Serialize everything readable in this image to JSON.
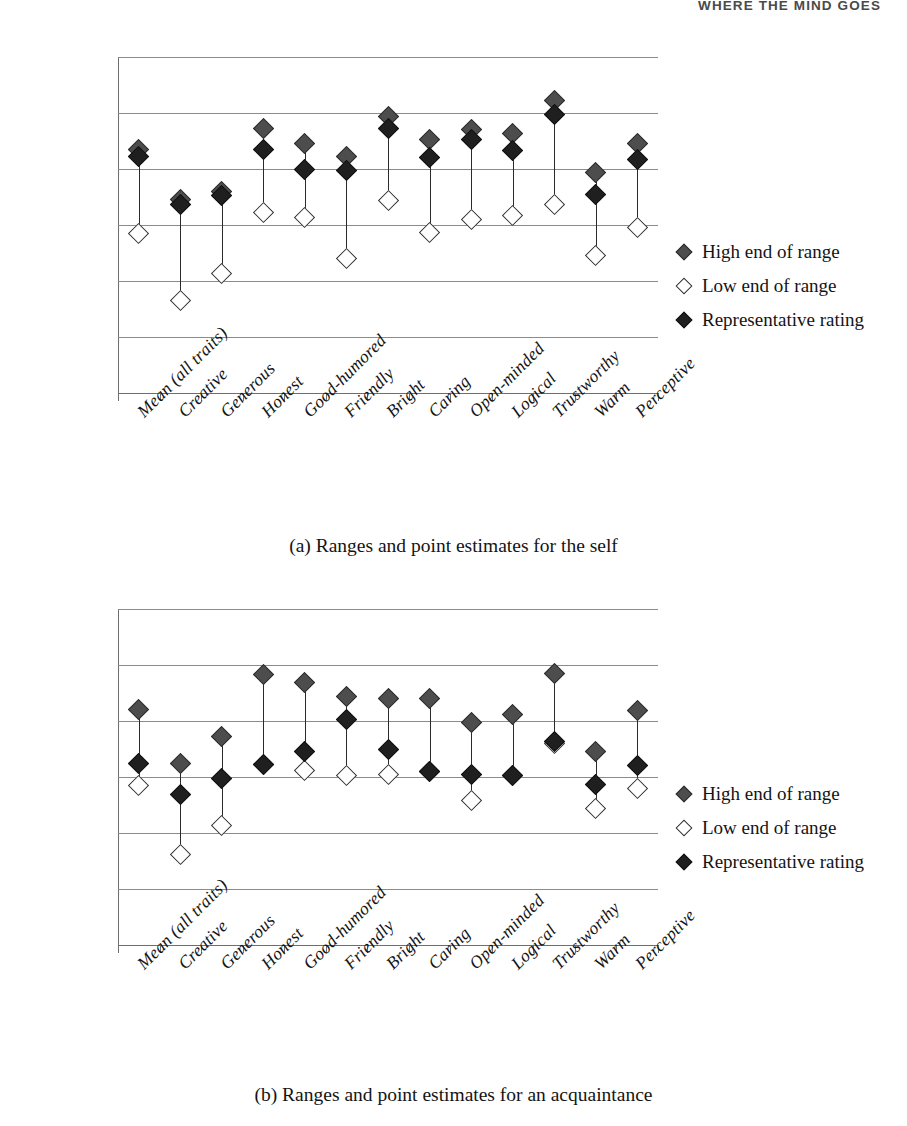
{
  "page": {
    "running_head": "WHERE THE MIND GOES"
  },
  "legend": {
    "items": [
      {
        "key": "high",
        "label": "High end of range",
        "marker": "filled-diamond-gray"
      },
      {
        "key": "low",
        "label": "Low end of range",
        "marker": "open-diamond"
      },
      {
        "key": "rep",
        "label": "Representative rating",
        "marker": "filled-diamond-black"
      }
    ]
  },
  "figures": [
    {
      "id": "a",
      "caption": "(a) Ranges and point estimates for the self",
      "chart_data": {
        "type": "scatter",
        "title": "",
        "xlabel": "",
        "ylabel": "",
        "ylim": [
          30,
          90
        ],
        "yticks": [
          30,
          40,
          50,
          60,
          70,
          80,
          90
        ],
        "grid": true,
        "legend_position": "right",
        "categories": [
          "Mean (all traits)",
          "Creative",
          "Generous",
          "Honest",
          "Good-humored",
          "Friendly",
          "Bright",
          "Caring",
          "Open-minded",
          "Logical",
          "Trustworthy",
          "Warm",
          "Perceptive"
        ],
        "series": [
          {
            "name": "High end of range",
            "values": [
              73.5,
              64.5,
              66.0,
              77.3,
              74.5,
              72.3,
              79.3,
              75.3,
              77.0,
              76.3,
              82.3,
              69.3,
              74.5
            ]
          },
          {
            "name": "Low end of range",
            "values": [
              58.5,
              46.6,
              51.3,
              62.2,
              61.3,
              54.0,
              64.3,
              58.6,
              61.0,
              61.7,
              63.6,
              54.6,
              59.5
            ]
          },
          {
            "name": "Representative rating",
            "values": [
              72.2,
              63.6,
              65.2,
              73.5,
              70.0,
              69.8,
              77.2,
              72.0,
              75.2,
              73.3,
              79.8,
              65.5,
              71.7
            ]
          }
        ]
      }
    },
    {
      "id": "b",
      "caption": "(b) Ranges and point estimates for an acquaintance",
      "chart_data": {
        "type": "scatter",
        "title": "",
        "xlabel": "",
        "ylabel": "",
        "ylim": [
          30,
          90
        ],
        "yticks": [
          30,
          40,
          50,
          60,
          70,
          80,
          90
        ],
        "grid": true,
        "legend_position": "right",
        "categories": [
          "Mean (all traits)",
          "Creative",
          "Generous",
          "Honest",
          "Good-humored",
          "Friendly",
          "Bright",
          "Caring",
          "Open-minded",
          "Logical",
          "Trustworthy",
          "Warm",
          "Perceptive"
        ],
        "series": [
          {
            "name": "High end of range",
            "values": [
              72.0,
              62.5,
              67.3,
              78.3,
              76.8,
              74.4,
              74.0,
              74.0,
              69.7,
              71.2,
              78.4,
              64.5,
              71.9
            ]
          },
          {
            "name": "Low end of range",
            "values": [
              58.5,
              46.1,
              51.3,
              62.2,
              61.2,
              60.3,
              60.4,
              61.0,
              55.8,
              60.2,
              66.0,
              54.3,
              57.9
            ]
          },
          {
            "name": "Representative rating",
            "values": [
              62.4,
              56.9,
              59.8,
              62.3,
              64.6,
              70.2,
              64.9,
              61.0,
              60.4,
              60.2,
              66.4,
              58.7,
              62.1
            ]
          }
        ]
      }
    }
  ]
}
